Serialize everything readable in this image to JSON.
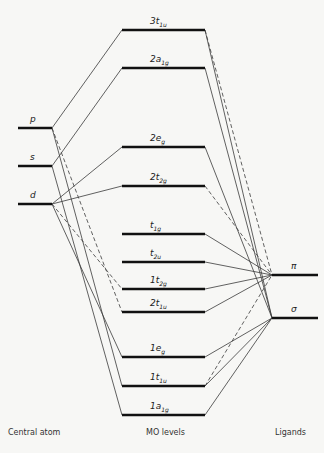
{
  "diagram": {
    "type": "molecular-orbital-diagram",
    "columns": {
      "central_atom": "Central atom",
      "mo_levels": "MO levels",
      "ligands": "Ligands"
    },
    "central_atom_orbitals": [
      {
        "id": "p",
        "label": "p",
        "y": 128
      },
      {
        "id": "s",
        "label": "s",
        "y": 166
      },
      {
        "id": "d",
        "label": "d",
        "y": 204
      }
    ],
    "mo_levels": [
      {
        "id": "3t1u",
        "main": "3t",
        "sub": "1u",
        "y": 30
      },
      {
        "id": "2a1g",
        "main": "2a",
        "sub": "1g",
        "y": 68
      },
      {
        "id": "2eg",
        "main": "2e",
        "sub": "g",
        "y": 147
      },
      {
        "id": "2t2g",
        "main": "2t",
        "sub": "2g",
        "y": 186
      },
      {
        "id": "t1g",
        "main": "t",
        "sub": "1g",
        "y": 234
      },
      {
        "id": "t2u",
        "main": "t",
        "sub": "2u",
        "y": 262
      },
      {
        "id": "1t2g",
        "main": "1t",
        "sub": "2g",
        "y": 289
      },
      {
        "id": "2t1u",
        "main": "2t",
        "sub": "1u",
        "y": 312
      },
      {
        "id": "1eg",
        "main": "1e",
        "sub": "g",
        "y": 357
      },
      {
        "id": "1t1u",
        "main": "1t",
        "sub": "1u",
        "y": 386
      },
      {
        "id": "1a1g",
        "main": "1a",
        "sub": "1g",
        "y": 415
      }
    ],
    "ligand_orbitals": [
      {
        "id": "pi",
        "label": "π",
        "y": 275
      },
      {
        "id": "sigma",
        "label": "σ",
        "y": 318
      }
    ],
    "connections": [
      {
        "from": "p",
        "to": "3t1u",
        "style": "solid"
      },
      {
        "from": "s",
        "to": "2a1g",
        "style": "solid"
      },
      {
        "from": "d",
        "to": "2eg",
        "style": "solid"
      },
      {
        "from": "d",
        "to": "2t2g",
        "style": "solid"
      },
      {
        "from": "p",
        "to": "2t1u",
        "style": "dashed"
      },
      {
        "from": "d",
        "to": "1t2g",
        "style": "dashed"
      },
      {
        "from": "d",
        "to": "1eg",
        "style": "solid"
      },
      {
        "from": "p",
        "to": "1t1u",
        "style": "solid"
      },
      {
        "from": "s",
        "to": "1a1g",
        "style": "solid"
      },
      {
        "from": "3t1u",
        "to": "sigma",
        "style": "solid"
      },
      {
        "from": "3t1u",
        "to": "pi",
        "style": "dashed"
      },
      {
        "from": "2a1g",
        "to": "sigma",
        "style": "solid"
      },
      {
        "from": "2eg",
        "to": "sigma",
        "style": "solid"
      },
      {
        "from": "2t2g",
        "to": "pi",
        "style": "dashed"
      },
      {
        "from": "t1g",
        "to": "pi",
        "style": "solid"
      },
      {
        "from": "t2u",
        "to": "pi",
        "style": "solid"
      },
      {
        "from": "1t2g",
        "to": "pi",
        "style": "solid"
      },
      {
        "from": "2t1u",
        "to": "pi",
        "style": "solid"
      },
      {
        "from": "1eg",
        "to": "sigma",
        "style": "solid"
      },
      {
        "from": "1t1u",
        "to": "sigma",
        "style": "solid"
      },
      {
        "from": "1t1u",
        "to": "pi",
        "style": "dashed"
      },
      {
        "from": "1a1g",
        "to": "sigma",
        "style": "solid"
      }
    ]
  }
}
